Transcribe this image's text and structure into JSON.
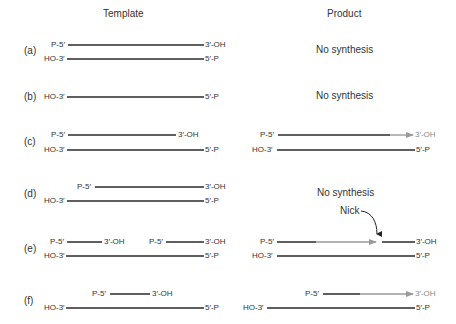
{
  "headers": {
    "template": "Template",
    "product": "Product"
  },
  "rows": [
    {
      "id": "(a)",
      "product_text": "No synthesis"
    },
    {
      "id": "(b)",
      "product_text": "No synthesis"
    },
    {
      "id": "(c)"
    },
    {
      "id": "(d)",
      "product_text": "No synthesis"
    },
    {
      "id": "(e)",
      "nick_label": "Nick"
    },
    {
      "id": "(f)"
    }
  ],
  "labels": {
    "p5": "P-5′",
    "ho3": "HO-3′",
    "oh3": "3′-OH",
    "p5end": "5′-P"
  },
  "colors": {
    "strand": "#2a2a2a",
    "new_synthesis": "#9a9a9a",
    "text": "#333333"
  }
}
